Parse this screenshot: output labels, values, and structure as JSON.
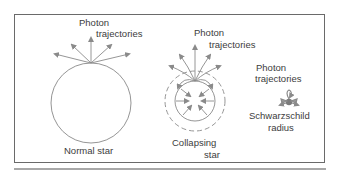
{
  "panels": [
    {
      "id": "normal-star",
      "trajectory_label_line1": "Photon",
      "trajectory_label_line2": "trajectories",
      "caption": "Normal star"
    },
    {
      "id": "collapsing-star",
      "trajectory_label_line1": "Photon",
      "trajectory_label_line2": "trajectories",
      "caption_line1": "Collapsing",
      "caption_line2": "star"
    },
    {
      "id": "black-hole",
      "trajectory_label_line1": "Photon",
      "trajectory_label_line2": "trajectories",
      "caption_line1": "Schwarzschild",
      "caption_line2": "radius"
    }
  ],
  "colors": {
    "arrow": "#8a8a8a",
    "outline": "#6a6a6a",
    "text": "#3c3c3c"
  }
}
